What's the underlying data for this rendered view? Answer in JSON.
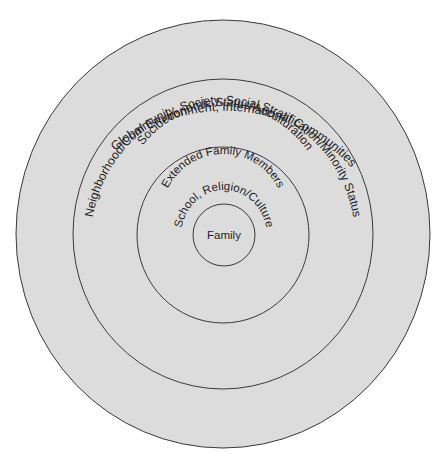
{
  "diagram": {
    "type": "concentric-circles",
    "colors": {
      "fill": "#dcdcdc",
      "stroke": "#3a3a3a",
      "text": "#1e1e1e",
      "background": "#ffffff"
    },
    "rings": [
      {
        "level": 1,
        "label": "Family"
      },
      {
        "level": 2,
        "labels": [
          "Extended Family Members",
          "School, Religion/Culture"
        ]
      },
      {
        "level": 3,
        "labels": [
          "Neighborhood/Community, Society, Social Stratification/Minority Status",
          "Socioeconomic Status/Acculturation"
        ]
      },
      {
        "level": 4,
        "label": "Global Environment, International Communities"
      }
    ]
  },
  "labels": {
    "family": "Family",
    "school": "School, Religion/Culture",
    "extended": "Extended Family Members",
    "socioeconomic": "Socioeconomic Status/Acculturation",
    "neighborhood": "Neighborhood/Community, Society, Social Stratification/Minority Status",
    "global": "Global Environment, International Communities"
  }
}
